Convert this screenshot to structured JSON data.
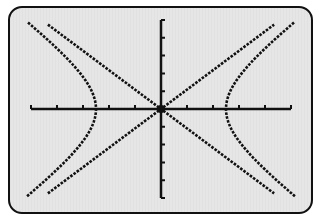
{
  "chart_data": {
    "type": "line",
    "title": "",
    "xlabel": "",
    "ylabel": "",
    "xlim": [
      -5,
      5
    ],
    "ylim": [
      -5,
      5
    ],
    "x_ticks": [
      -5,
      -4,
      -3,
      -2,
      -1,
      1,
      2,
      3,
      4,
      5
    ],
    "y_ticks": [
      -5,
      -4,
      -3,
      -2,
      -1,
      1,
      2,
      3,
      4,
      5
    ],
    "grid": false,
    "series": [
      {
        "name": "hyperbola",
        "equation": "x^2/6.25 - y^2/7.4 = 1",
        "vertices": [
          [
            -2.5,
            0
          ],
          [
            2.5,
            0
          ]
        ]
      },
      {
        "name": "asymptote_1",
        "equation": "y = 1.09x"
      },
      {
        "name": "asymptote_2",
        "equation": "y = -1.09x"
      }
    ],
    "colors": {
      "curve": "#111111",
      "axes": "#111111",
      "screen": "#e6e6e6"
    }
  }
}
